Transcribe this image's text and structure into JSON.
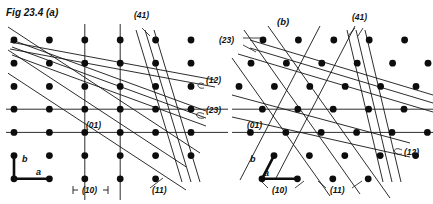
{
  "figure": {
    "title": "Fig 23.4 (a)",
    "panels": [
      {
        "id": "a",
        "label": "",
        "lattice": {
          "type": "rectangular",
          "origin": [
            14,
            40
          ],
          "a_vector": [
            35.4,
            0
          ],
          "b_vector": [
            0,
            23.2
          ],
          "cols": 6,
          "rows": 6,
          "dot_radius": 3.4
        },
        "annotations": [
          {
            "name": "index-41",
            "text": "(41)",
            "x": 134,
            "y": 18
          },
          {
            "name": "index-12",
            "text": "(12)",
            "x": 206,
            "y": 83
          },
          {
            "name": "index-23",
            "text": "(23)",
            "x": 206,
            "y": 113
          },
          {
            "name": "index-01",
            "text": "(01)",
            "x": 86,
            "y": 128
          },
          {
            "name": "index-10",
            "text": "(10)",
            "x": 82,
            "y": 190
          },
          {
            "name": "index-11",
            "text": "(11)",
            "x": 152,
            "y": 190
          },
          {
            "name": "vector-b",
            "text": "b",
            "x": 27,
            "y": 159
          },
          {
            "name": "vector-a",
            "text": "a",
            "x": 38,
            "y": 175
          }
        ]
      },
      {
        "id": "b",
        "label": "(b)",
        "lattice": {
          "type": "oblique",
          "origin": [
            239,
            40
          ],
          "a_vector": [
            35.4,
            0
          ],
          "b_vector": [
            -12.0,
            23.2
          ],
          "cols": 6,
          "rows": 6,
          "dot_radius": 3.4
        },
        "annotations": [
          {
            "name": "panel-label-b",
            "text": "(b)",
            "x": 277,
            "y": 22
          },
          {
            "name": "index-41",
            "text": "(41)",
            "x": 352,
            "y": 20
          },
          {
            "name": "index-23",
            "text": "(23)",
            "x": 221,
            "y": 41
          },
          {
            "name": "index-12",
            "text": "(12)",
            "x": 404,
            "y": 152
          },
          {
            "name": "index-01",
            "text": "(01)",
            "x": 247,
            "y": 128
          },
          {
            "name": "index-10",
            "text": "(10)",
            "x": 272,
            "y": 191
          },
          {
            "name": "index-11",
            "text": "(11)",
            "x": 330,
            "y": 191
          },
          {
            "name": "vector-b",
            "text": "b",
            "x": 253,
            "y": 160
          },
          {
            "name": "vector-a",
            "text": "a",
            "x": 265,
            "y": 176
          }
        ]
      }
    ],
    "colors": {
      "ink": "#111111",
      "background": "#ffffff"
    }
  }
}
